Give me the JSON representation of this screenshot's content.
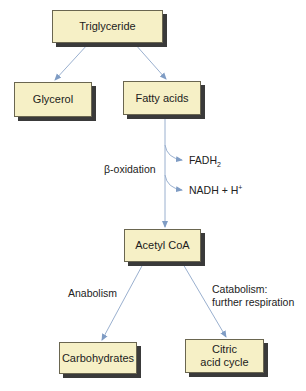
{
  "nodes": {
    "triglyceride": "Triglyceride",
    "glycerol": "Glycerol",
    "fatty_acids": "Fatty acids",
    "acetyl_coa": "Acetyl CoA",
    "carbohydrates": "Carbohydrates",
    "citric_line1": "Citric",
    "citric_line2": "acid cycle"
  },
  "labels": {
    "beta_oxidation": "β-oxidation",
    "fadh_main": "FADH",
    "fadh_sub": "2",
    "nadh_main": "NADH + H",
    "nadh_sup": "+",
    "anabolism": "Anabolism",
    "catabolism_line1": "Catabolism:",
    "catabolism_line2": "further respiration"
  },
  "colors": {
    "box_fill": "#f6f0c6",
    "arrow": "#8fa8c8"
  }
}
